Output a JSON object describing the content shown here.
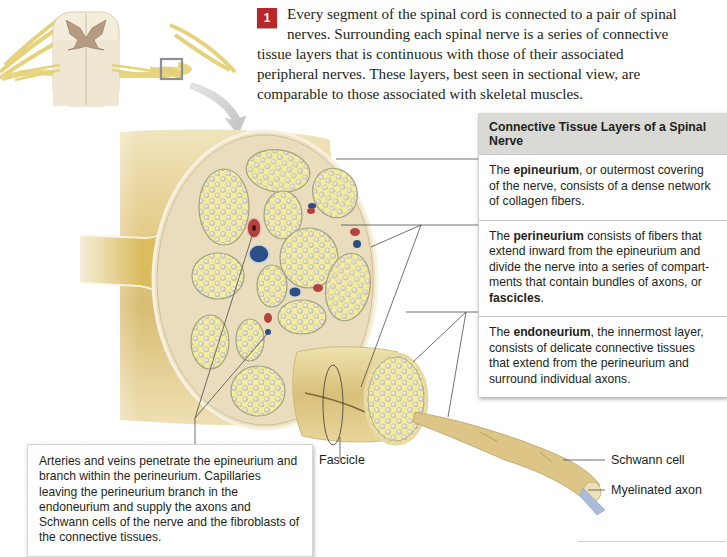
{
  "intro": {
    "step_number": "1",
    "text": "Every segment of the spinal cord is connected to a pair of spinal nerves. Surrounding each spinal nerve is a series of connective tissue layers that is continuous with those of their associated peripheral nerves. These layers, best seen in sectional view, are comparable to those associated with skeletal muscles."
  },
  "panel": {
    "title": "Connective Tissue Layers of a Spinal Nerve",
    "sections": [
      {
        "prefix": "The ",
        "term": "epineurium",
        "suffix": ", or outermost covering of the nerve, consists of a dense network of collagen fibers."
      },
      {
        "prefix": "The ",
        "term": "perineurium",
        "suffix": " consists of fibers that extend inward from the epineurium and divide the nerve into a series of compart­ments that contain bundles of axons, or ",
        "term2": "fascicles",
        "suffix2": "."
      },
      {
        "prefix": "The ",
        "term": "endoneurium",
        "suffix": ", the innermost layer, consists of delicate connective tissues that extend from the perineurium and surround individual axons."
      }
    ]
  },
  "callout": {
    "text": "Arteries and veins penetrate the epineurium and branch within the perineurium. Capillaries leaving the perineurium branch in the endoneurium and supply the axons and Schwann cells of the nerve and the fibroblasts of the connective tissues."
  },
  "labels": {
    "fascicle": "Fascicle",
    "schwann_cell": "Schwann cell",
    "myelinated_axon": "Myelinated axon"
  },
  "colors": {
    "step_badge": "#b8282a",
    "nerve_tan": "#e2cc8c",
    "fascicle_fill": "#f3eea0",
    "axon": "#d9d4c6",
    "artery": "#b5423e",
    "vein": "#2c4f86",
    "panel_header": "#d9d9d6"
  }
}
